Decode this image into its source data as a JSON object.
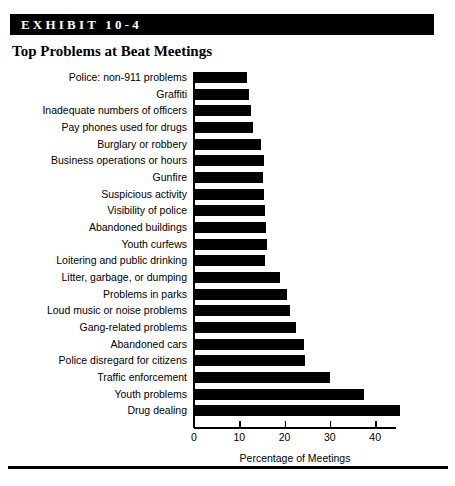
{
  "exhibit": {
    "banner_label": "EXHIBIT 10-4",
    "title": "Top Problems at Beat Meetings"
  },
  "colors": {
    "bar_fill": "#000000",
    "banner_background": "#000000",
    "banner_text": "#ffffff",
    "page_background": "#ffffff",
    "axis": "#000000"
  },
  "axis": {
    "tick_labels": [
      "0",
      "10",
      "20",
      "30",
      "40"
    ],
    "title": "Percentage of Meetings"
  },
  "chart_data": {
    "type": "bar",
    "orientation": "horizontal",
    "title": "Top Problems at Beat Meetings",
    "xlabel": "Percentage of Meetings",
    "ylabel": "",
    "xlim": [
      0,
      45
    ],
    "xticks": [
      0,
      10,
      20,
      30,
      40
    ],
    "grid": false,
    "legend": false,
    "bar_color": "#000000",
    "categories": [
      "Police: non-911 problems",
      "Graffiti",
      "Inadequate numbers of officers",
      "Pay phones used for drugs",
      "Burglary or robbery",
      "Business operations or hours",
      "Gunfire",
      "Suspicious activity",
      "Visibility of police",
      "Abandoned buildings",
      "Youth curfews",
      "Loitering and public drinking",
      "Litter, garbage, or dumping",
      "Problems in parks",
      "Loud music or noise problems",
      "Gang-related problems",
      "Abandoned cars",
      "Police disregard for citizens",
      "Traffic enforcement",
      "Youth problems",
      "Drug dealing"
    ],
    "values": [
      11.7,
      12.1,
      12.6,
      13.0,
      14.8,
      15.5,
      15.3,
      15.5,
      15.7,
      15.9,
      16.1,
      15.7,
      19.0,
      20.5,
      21.2,
      22.5,
      24.3,
      24.5,
      30.0,
      37.5,
      45.5
    ]
  }
}
